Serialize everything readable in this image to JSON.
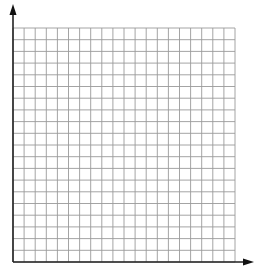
{
  "diagram": {
    "type": "coordinate-grid",
    "columns": 20,
    "rows": 20,
    "grid_color": "#9a9a9a",
    "axis_color": "#222222",
    "background": "#ffffff",
    "x_axis": {
      "label": "",
      "arrow": "right"
    },
    "y_axis": {
      "label": "",
      "arrow": "up"
    }
  }
}
